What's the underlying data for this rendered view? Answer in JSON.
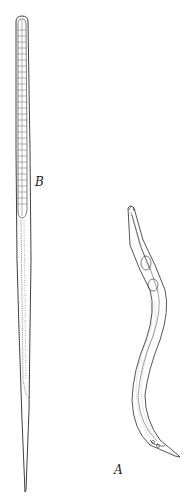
{
  "figure": {
    "labels": {
      "b": "B",
      "a": "A"
    },
    "colors": {
      "ink": "#2a2a2a",
      "background": "#ffffff"
    }
  }
}
